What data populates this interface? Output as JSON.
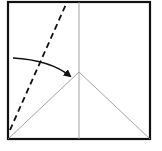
{
  "diagram": {
    "type": "origami-fold-step",
    "colors": {
      "border": "#111111",
      "crease": "#999999",
      "dashed": "#111111",
      "arrow": "#111111"
    },
    "square": {
      "x1": 8,
      "y1": 2,
      "x2": 150,
      "y2": 139
    },
    "center_crease": {
      "x": 79
    },
    "apex": {
      "x": 79,
      "y": 72
    },
    "valley_fold_line": {
      "from": [
        10,
        130
      ],
      "to": [
        67,
        2
      ]
    },
    "arrow": {
      "from": [
        13,
        58
      ],
      "to": [
        71,
        76
      ]
    }
  }
}
